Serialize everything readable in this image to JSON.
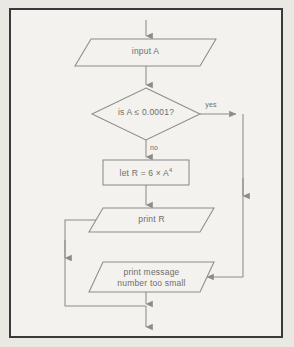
{
  "figure": {
    "type": "flowchart",
    "title": "",
    "frame": {
      "border_color": "#3a3a3c",
      "page_background": "#e9e8e3",
      "inner_background": "#f3f2ee"
    },
    "stroke_color": "#8d8c89",
    "text_color": "#6f6e6b"
  },
  "nodes": [
    {
      "id": "input-a",
      "shape": "parallelogram",
      "name": "input-a-node",
      "label": "input A"
    },
    {
      "id": "decision",
      "shape": "diamond",
      "name": "decision-node",
      "label": "is A ≤ 0.0001?"
    },
    {
      "id": "assign-r",
      "shape": "rectangle",
      "name": "process-node",
      "label_prefix": "let R = 6 × A",
      "label_exponent": "4",
      "label_plain": "let R = 6 × A⁴"
    },
    {
      "id": "print-r",
      "shape": "parallelogram",
      "name": "print-r-node",
      "label": "print R"
    },
    {
      "id": "print-message",
      "shape": "parallelogram",
      "name": "print-message-node",
      "label_line1": "print message",
      "label_line2": "number too small"
    }
  ],
  "edge_labels": {
    "yes": "yes",
    "no": "no"
  },
  "edges": [
    {
      "from": "start",
      "to": "input-a",
      "label": ""
    },
    {
      "from": "input-a",
      "to": "decision",
      "label": ""
    },
    {
      "from": "decision",
      "to": "print-message",
      "label": "yes",
      "route": "right-down-left"
    },
    {
      "from": "decision",
      "to": "assign-r",
      "label": "no",
      "route": "down"
    },
    {
      "from": "assign-r",
      "to": "print-r",
      "label": ""
    },
    {
      "from": "print-r",
      "to": "bottom-exit",
      "label": "",
      "route": "left-down-right"
    },
    {
      "from": "print-message",
      "to": "bottom-exit",
      "label": "",
      "route": "down"
    }
  ]
}
